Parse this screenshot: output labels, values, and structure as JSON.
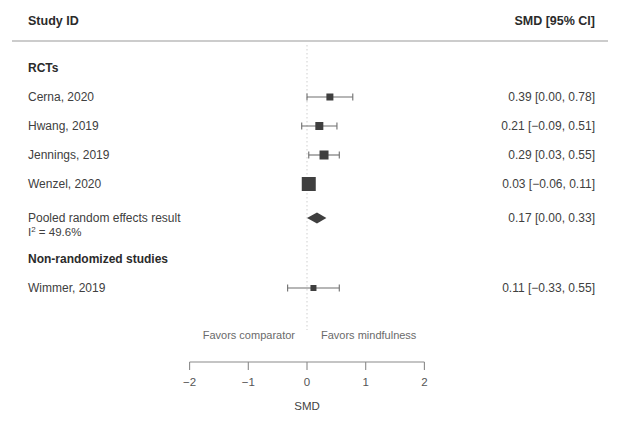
{
  "header": {
    "left_label": "Study ID",
    "right_label": "SMD [95% CI]"
  },
  "groups": [
    {
      "label": "RCTs"
    },
    {
      "label": "Non-randomized studies"
    }
  ],
  "pooled": {
    "label": "Pooled random effects result",
    "heterogeneity_prefix": "I",
    "heterogeneity_sup": "2",
    "heterogeneity_value": " = 49.6%",
    "estimate_label": "0.17 [0.00, 0.33]"
  },
  "axis": {
    "title": "SMD",
    "tick_labels": [
      "−2",
      "−1",
      "0",
      "1",
      "2"
    ],
    "tick_values": [
      -2,
      -1,
      0,
      1,
      2
    ],
    "favors_left": "Favors comparator",
    "favors_right": "Favors mindfulness",
    "zero_line_value": 0
  },
  "colors": {
    "marker": "#3f3f3f",
    "line": "#6e6e6e",
    "rule": "#9a9a9a",
    "zero_line": "#cfcfcf",
    "axis": "#8a8a8a",
    "text": "#404040",
    "heading": "#2b2b2b"
  },
  "chart_data": {
    "type": "forest",
    "title": "",
    "xlabel": "SMD",
    "ylabel": "",
    "xlim": [
      -2,
      2
    ],
    "grid": false,
    "effect_measure": "SMD",
    "ci_level": "95%",
    "zero_reference": 0,
    "rows": [
      {
        "kind": "group",
        "label": "RCTs"
      },
      {
        "kind": "study",
        "label": "Cerna, 2020",
        "estimate": 0.39,
        "ci_low": 0.0,
        "ci_high": 0.78,
        "estimate_label": "0.39 [0.00, 0.78]",
        "weight_box": 7.0
      },
      {
        "kind": "study",
        "label": "Hwang, 2019",
        "estimate": 0.21,
        "ci_low": -0.09,
        "ci_high": 0.51,
        "estimate_label": "0.21 [−0.09, 0.51]",
        "weight_box": 8.0
      },
      {
        "kind": "study",
        "label": "Jennings, 2019",
        "estimate": 0.29,
        "ci_low": 0.03,
        "ci_high": 0.55,
        "estimate_label": "0.29 [0.03, 0.55]",
        "weight_box": 9.0
      },
      {
        "kind": "study",
        "label": "Wenzel, 2020",
        "estimate": 0.03,
        "ci_low": -0.06,
        "ci_high": 0.11,
        "estimate_label": "0.03 [−0.06, 0.11]",
        "weight_box": 14.0
      },
      {
        "kind": "pooled",
        "label": "Pooled random effects result",
        "sublabel": "I2 = 49.6%",
        "estimate": 0.17,
        "ci_low": 0.0,
        "ci_high": 0.33,
        "estimate_label": "0.17 [0.00, 0.33]"
      },
      {
        "kind": "group",
        "label": "Non-randomized studies"
      },
      {
        "kind": "study",
        "label": "Wimmer, 2019",
        "estimate": 0.11,
        "ci_low": -0.33,
        "ci_high": 0.55,
        "estimate_label": "0.11 [−0.33, 0.55]",
        "weight_box": 6.0
      }
    ],
    "annotations": [
      "Favors comparator",
      "Favors mindfulness"
    ]
  },
  "layout": {
    "label_x": 28,
    "estimate_right_x": 595,
    "plot_zero_x": 307,
    "px_per_unit": 58.7,
    "rule_y": 41,
    "rule_x1": 12,
    "rule_x2": 608,
    "zero_top": 45,
    "zero_bottom": 330,
    "axis_y": 362,
    "tick_len": 8,
    "rows_y": {
      "group_rcts": 72,
      "cerna": 101,
      "hwang": 130,
      "jennings": 159,
      "wenzel": 188,
      "pooled": 222,
      "pooled_sub": 236,
      "group_nrs": 263,
      "wimmer": 292
    },
    "favors_y": 339,
    "tick_label_y": 386,
    "axis_title_y": 410,
    "header_y": 25
  }
}
